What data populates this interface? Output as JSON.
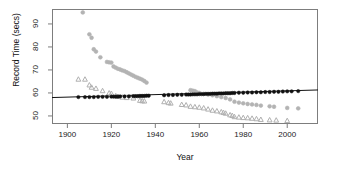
{
  "chart_data": {
    "type": "scatter",
    "title": "",
    "xlabel": "Year",
    "ylabel": "Record Time (secs)",
    "xlim": [
      1893,
      2014
    ],
    "ylim": [
      46.5,
      96.5
    ],
    "xticks": [
      1900,
      1920,
      1940,
      1960,
      1980,
      2000
    ],
    "yticks": [
      50,
      60,
      70,
      80,
      90
    ],
    "grid": false,
    "legend": "none",
    "series": [
      {
        "name": "gray-circles",
        "marker": "circle",
        "color": "#b3b3b3",
        "points": [
          [
            1907,
            95.0
          ],
          [
            1910,
            85.5
          ],
          [
            1911,
            84.0
          ],
          [
            1912,
            79.0
          ],
          [
            1913,
            78.0
          ],
          [
            1915,
            75.5
          ],
          [
            1918,
            73.5
          ],
          [
            1919,
            73.3
          ],
          [
            1920,
            73.2
          ],
          [
            1921,
            71.5
          ],
          [
            1922,
            71.0
          ],
          [
            1923,
            70.5
          ],
          [
            1924,
            70.2
          ],
          [
            1925,
            69.8
          ],
          [
            1926,
            69.5
          ],
          [
            1927,
            69.0
          ],
          [
            1928,
            68.5
          ],
          [
            1929,
            68.0
          ],
          [
            1930,
            67.5
          ],
          [
            1931,
            67.0
          ],
          [
            1932,
            66.6
          ],
          [
            1933,
            66.2
          ],
          [
            1934,
            65.8
          ],
          [
            1935,
            65.2
          ],
          [
            1936,
            64.5
          ],
          [
            1956,
            61.2
          ],
          [
            1957,
            61.0
          ],
          [
            1958,
            60.8
          ],
          [
            1959,
            60.2
          ],
          [
            1960,
            60.0
          ],
          [
            1962,
            59.6
          ],
          [
            1964,
            59.3
          ],
          [
            1966,
            59.0
          ],
          [
            1968,
            58.6
          ],
          [
            1970,
            58.2
          ],
          [
            1972,
            57.8
          ],
          [
            1974,
            57.2
          ],
          [
            1976,
            56.2
          ],
          [
            1978,
            55.8
          ],
          [
            1980,
            55.5
          ],
          [
            1982,
            55.2
          ],
          [
            1984,
            55.0
          ],
          [
            1986,
            54.8
          ],
          [
            1988,
            54.5
          ],
          [
            1992,
            54.2
          ],
          [
            1994,
            54.0
          ],
          [
            2000,
            53.5
          ],
          [
            2005,
            53.3
          ]
        ]
      },
      {
        "name": "gray-triangles",
        "marker": "triangle",
        "color": "#b0b0b0",
        "points": [
          [
            1905,
            66.0
          ],
          [
            1908,
            66.0
          ],
          [
            1910,
            63.5
          ],
          [
            1911,
            62.5
          ],
          [
            1913,
            62.0
          ],
          [
            1916,
            61.0
          ],
          [
            1919,
            60.0
          ],
          [
            1920,
            59.8
          ],
          [
            1922,
            58.8
          ],
          [
            1923,
            58.5
          ],
          [
            1925,
            58.2
          ],
          [
            1927,
            58.0
          ],
          [
            1930,
            57.8
          ],
          [
            1933,
            56.8
          ],
          [
            1934,
            56.6
          ],
          [
            1935,
            56.5
          ],
          [
            1944,
            56.2
          ],
          [
            1946,
            55.8
          ],
          [
            1947,
            55.6
          ],
          [
            1952,
            55.0
          ],
          [
            1954,
            54.8
          ],
          [
            1956,
            54.2
          ],
          [
            1958,
            54.0
          ],
          [
            1960,
            53.8
          ],
          [
            1962,
            53.5
          ],
          [
            1964,
            53.0
          ],
          [
            1966,
            52.5
          ],
          [
            1968,
            52.2
          ],
          [
            1970,
            51.8
          ],
          [
            1971,
            51.5
          ],
          [
            1972,
            51.2
          ],
          [
            1974,
            50.5
          ],
          [
            1975,
            50.2
          ],
          [
            1976,
            49.7
          ],
          [
            1978,
            49.5
          ],
          [
            1980,
            49.3
          ],
          [
            1982,
            49.2
          ],
          [
            1984,
            49.0
          ],
          [
            1986,
            48.8
          ],
          [
            1988,
            48.5
          ],
          [
            1992,
            48.3
          ],
          [
            1995,
            48.2
          ],
          [
            2000,
            48.0
          ]
        ]
      },
      {
        "name": "black-dots",
        "marker": "filled-circle",
        "color": "#111111",
        "points": [
          [
            1905,
            58.2
          ],
          [
            1908,
            58.2
          ],
          [
            1910,
            58.2
          ],
          [
            1912,
            58.2
          ],
          [
            1914,
            58.3
          ],
          [
            1916,
            58.3
          ],
          [
            1918,
            58.3
          ],
          [
            1920,
            58.4
          ],
          [
            1921,
            58.4
          ],
          [
            1922,
            58.4
          ],
          [
            1923,
            58.4
          ],
          [
            1924,
            58.5
          ],
          [
            1926,
            58.5
          ],
          [
            1928,
            58.5
          ],
          [
            1930,
            58.6
          ],
          [
            1931,
            58.6
          ],
          [
            1932,
            58.6
          ],
          [
            1933,
            58.7
          ],
          [
            1934,
            58.7
          ],
          [
            1935,
            58.7
          ],
          [
            1936,
            58.8
          ],
          [
            1937,
            58.8
          ],
          [
            1944,
            59.0
          ],
          [
            1946,
            59.1
          ],
          [
            1948,
            59.1
          ],
          [
            1950,
            59.2
          ],
          [
            1952,
            59.2
          ],
          [
            1954,
            59.3
          ],
          [
            1955,
            59.3
          ],
          [
            1956,
            59.3
          ],
          [
            1957,
            59.4
          ],
          [
            1958,
            59.4
          ],
          [
            1959,
            59.4
          ],
          [
            1960,
            59.5
          ],
          [
            1961,
            59.5
          ],
          [
            1962,
            59.5
          ],
          [
            1963,
            59.6
          ],
          [
            1964,
            59.6
          ],
          [
            1965,
            59.6
          ],
          [
            1966,
            59.7
          ],
          [
            1967,
            59.7
          ],
          [
            1968,
            59.7
          ],
          [
            1969,
            59.8
          ],
          [
            1970,
            59.8
          ],
          [
            1971,
            59.8
          ],
          [
            1972,
            59.9
          ],
          [
            1973,
            59.9
          ],
          [
            1974,
            59.9
          ],
          [
            1975,
            60.0
          ],
          [
            1976,
            60.0
          ],
          [
            1978,
            60.1
          ],
          [
            1980,
            60.1
          ],
          [
            1982,
            60.2
          ],
          [
            1984,
            60.2
          ],
          [
            1986,
            60.3
          ],
          [
            1988,
            60.3
          ],
          [
            1990,
            60.4
          ],
          [
            1992,
            60.4
          ],
          [
            1994,
            60.5
          ],
          [
            1996,
            60.5
          ],
          [
            1998,
            60.6
          ],
          [
            2000,
            60.7
          ],
          [
            2002,
            60.7
          ],
          [
            2005,
            60.8
          ]
        ]
      }
    ],
    "trend_line": {
      "name": "regression-line",
      "color": "#111111",
      "start": [
        1893,
        58.0
      ],
      "end": [
        2014,
        61.3
      ]
    }
  },
  "axes": {
    "y_label": "Record Time (secs)",
    "x_label": "Year",
    "y_tick_labels": [
      "50",
      "60",
      "70",
      "80",
      "90"
    ],
    "x_tick_labels": [
      "1900",
      "1920",
      "1940",
      "1960",
      "1980",
      "2000"
    ]
  }
}
